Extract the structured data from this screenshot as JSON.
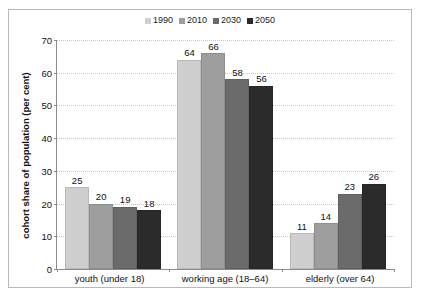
{
  "chart_data": {
    "type": "bar",
    "title": "",
    "xlabel": "",
    "ylabel": "cohort share of population (per cent)",
    "ylim": [
      0,
      70
    ],
    "yticks": [
      0,
      10,
      20,
      30,
      40,
      50,
      60,
      70
    ],
    "grid": true,
    "legend_position": "top-center",
    "categories": [
      "youth (under 18)",
      "working age (18–64)",
      "elderly (over 64)"
    ],
    "series": [
      {
        "name": "1990",
        "color": "#cfcfcf",
        "values": [
          25,
          64,
          11
        ]
      },
      {
        "name": "2010",
        "color": "#9e9e9e",
        "values": [
          20,
          66,
          14
        ]
      },
      {
        "name": "2030",
        "color": "#6b6b6b",
        "values": [
          19,
          58,
          23
        ]
      },
      {
        "name": "2050",
        "color": "#2b2b2b",
        "values": [
          18,
          56,
          26
        ]
      }
    ]
  },
  "colors": {
    "frame_border": "#b9b9b9",
    "axis_line": "#8a8a8a",
    "gridline": "#c6c6c6",
    "text": "#111111",
    "background": "#ffffff"
  }
}
